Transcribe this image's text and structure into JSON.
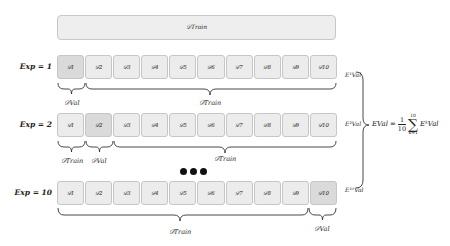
{
  "train_bar": {
    "label": "𝒟Train"
  },
  "rows": [
    {
      "exp_label": "Exp = 1",
      "folds": [
        "𝒟1",
        "𝒟2",
        "𝒟3",
        "𝒟4",
        "𝒟5",
        "𝒟6",
        "𝒟7",
        "𝒟8",
        "𝒟9",
        "𝒟10"
      ],
      "val_index": 0,
      "braces": [
        {
          "label": "𝒟Val"
        },
        {
          "label": "𝒟Train"
        }
      ],
      "error_label": "E¹Val"
    },
    {
      "exp_label": "Exp = 2",
      "folds": [
        "𝒟1",
        "𝒟2",
        "𝒟3",
        "𝒟4",
        "𝒟5",
        "𝒟6",
        "𝒟7",
        "𝒟8",
        "𝒟9",
        "𝒟10"
      ],
      "val_index": 1,
      "braces": [
        {
          "label": "𝒟Train"
        },
        {
          "label": "𝒟Val"
        },
        {
          "label": "𝒟Train"
        }
      ],
      "error_label": "E²Val"
    },
    {
      "exp_label": "Exp = 10",
      "folds": [
        "𝒟1",
        "𝒟2",
        "𝒟3",
        "𝒟4",
        "𝒟5",
        "𝒟6",
        "𝒟7",
        "𝒟8",
        "𝒟9",
        "𝒟10"
      ],
      "val_index": 9,
      "braces": [
        {
          "label": "𝒟Train"
        },
        {
          "label": "𝒟Val"
        }
      ],
      "error_label": "E¹⁰Val"
    }
  ],
  "ellipsis": "•••",
  "formula": {
    "lhs": "EVal",
    "equals": "=",
    "frac_num": "1",
    "frac_den": "10",
    "sum_upper": "10",
    "sum_lower": "k=1",
    "sum_symbol": "∑",
    "term": "EᵏVal"
  },
  "colors": {
    "fold_fill": "#ececec",
    "val_fill": "#dadada",
    "border": "#c6c6c6",
    "ink": "#222222"
  }
}
